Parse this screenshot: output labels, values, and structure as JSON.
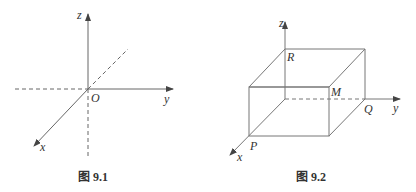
{
  "figures": [
    {
      "id": "fig-9-1",
      "caption": "图 9.1",
      "labels": {
        "z": "z",
        "y": "y",
        "x": "x",
        "origin": "O"
      }
    },
    {
      "id": "fig-9-2",
      "caption": "图 9.2",
      "labels": {
        "z": "z",
        "y": "y",
        "x": "x",
        "R": "R",
        "M": "M",
        "Q": "Q",
        "P": "P"
      }
    }
  ],
  "colors": {
    "line": "#555555",
    "text": "#333333"
  }
}
